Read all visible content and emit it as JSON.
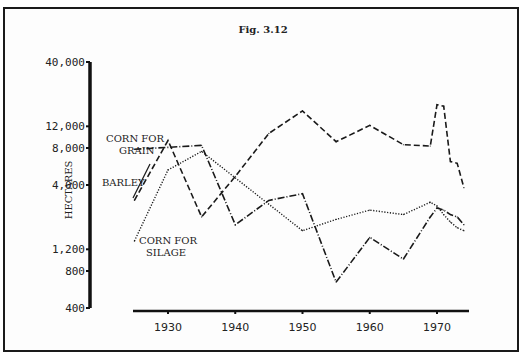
{
  "chart_data": {
    "type": "line",
    "title": "Fig. 3.12",
    "xlabel": "",
    "ylabel": "HECTARES",
    "yscale": "log",
    "ylim": [
      400,
      40000
    ],
    "xlim": [
      1922,
      1975
    ],
    "yticks": [
      400,
      800,
      1200,
      4000,
      8000,
      12000,
      40000
    ],
    "ytick_labels": [
      "400",
      "800",
      "1,200",
      "4,000",
      "8,000",
      "12,000",
      "40,000"
    ],
    "xticks": [
      1930,
      1940,
      1950,
      1960,
      1970
    ],
    "xtick_labels": [
      "1930",
      "1940",
      "1950",
      "1960",
      "1970"
    ],
    "grid": false,
    "legend": "inline-labels",
    "series": [
      {
        "name": "CORN FOR GRAIN",
        "label_lines": [
          "CORN FOR",
          "GRAIN"
        ],
        "style": "dash-dot",
        "x": [
          1925,
          1935,
          1940,
          1945,
          1950,
          1955,
          1960,
          1965,
          1969,
          1970,
          1971,
          1972,
          1973,
          1974
        ],
        "y": [
          7800,
          8400,
          1900,
          3000,
          3400,
          650,
          1500,
          1000,
          2200,
          2600,
          2500,
          2300,
          2200,
          1900
        ]
      },
      {
        "name": "BARLEY",
        "label_lines": [
          "BARLEY"
        ],
        "style": "long-dash",
        "x": [
          1925,
          1930,
          1935,
          1940,
          1945,
          1950,
          1955,
          1960,
          1965,
          1969,
          1970,
          1971,
          1972,
          1973,
          1974
        ],
        "y": [
          3000,
          9200,
          2200,
          4700,
          10500,
          16000,
          9000,
          12200,
          8500,
          8300,
          18000,
          17500,
          6200,
          6000,
          3800
        ]
      },
      {
        "name": "CORN FOR SILAGE",
        "label_lines": [
          "CORN FOR",
          "SILAGE"
        ],
        "style": "dotted",
        "x": [
          1925,
          1930,
          1935,
          1950,
          1955,
          1960,
          1965,
          1969,
          1970,
          1971,
          1972,
          1973,
          1974
        ],
        "y": [
          1400,
          5300,
          7500,
          1700,
          2100,
          2500,
          2300,
          2900,
          2700,
          2300,
          2000,
          1800,
          1700
        ]
      }
    ]
  }
}
